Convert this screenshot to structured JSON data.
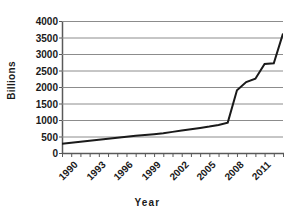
{
  "chart_data": {
    "type": "line",
    "title": "",
    "xlabel": "Year",
    "ylabel": "Billions",
    "xlim": [
      1990,
      2014
    ],
    "ylim": [
      0,
      4000
    ],
    "grid": true,
    "legend": false,
    "ytick_labels": [
      "4000",
      "3500",
      "3000",
      "2500",
      "2000",
      "1500",
      "1000",
      "500",
      "0"
    ],
    "ytick_values": [
      4000,
      3500,
      3000,
      2500,
      2000,
      1500,
      1000,
      500,
      0
    ],
    "xtick_labels": [
      "1990",
      "1993",
      "1996",
      "1999",
      "2002",
      "2005",
      "2008",
      "2011"
    ],
    "xtick_values": [
      1990,
      1993,
      1996,
      1999,
      2002,
      2005,
      2008,
      2011
    ],
    "x": [
      1990,
      1991,
      1992,
      1993,
      1994,
      1995,
      1996,
      1997,
      1998,
      1999,
      2000,
      2001,
      2002,
      2003,
      2004,
      2005,
      2006,
      2007,
      2008,
      2009,
      2010,
      2011,
      2012,
      2013,
      2014
    ],
    "values": [
      280,
      310,
      340,
      370,
      400,
      430,
      460,
      490,
      520,
      545,
      570,
      600,
      640,
      680,
      720,
      760,
      800,
      850,
      920,
      1900,
      2150,
      2250,
      2700,
      2720,
      3620
    ],
    "series": [
      {
        "name": "Billions",
        "color": "#1a1a1a",
        "values": [
          280,
          310,
          340,
          370,
          400,
          430,
          460,
          490,
          520,
          545,
          570,
          600,
          640,
          680,
          720,
          760,
          800,
          850,
          920,
          1900,
          2150,
          2250,
          2700,
          2720,
          3620
        ]
      }
    ],
    "colors": {
      "line": "#1a1a1a",
      "grid": "#8c8c8c",
      "axis": "#595959",
      "background": "#ffffff",
      "text": "#1a1a1a"
    }
  }
}
